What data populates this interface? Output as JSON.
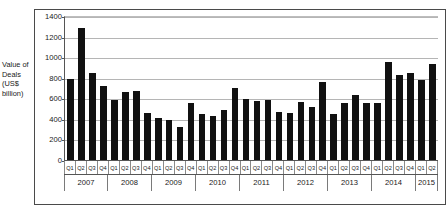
{
  "figure": {
    "faint_title": "",
    "axis_caption_lines": [
      "Value of",
      "Deals",
      "(US$",
      "billion)"
    ]
  },
  "chart_data": {
    "type": "bar",
    "title": "",
    "subtitle": "",
    "xlabel": "",
    "ylabel": "Value of Deals (US$ billion)",
    "ylim": [
      0,
      1400
    ],
    "yticks": [
      0,
      200,
      400,
      600,
      800,
      1000,
      1200,
      1400
    ],
    "ytick_labels": [
      "0",
      "200",
      "400",
      "600",
      "800",
      "1000",
      "1200",
      "1400"
    ],
    "grid": true,
    "legend": null,
    "bar_color": "#111111",
    "categories": [
      "Q1",
      "Q2",
      "Q3",
      "Q4",
      "Q1",
      "Q2",
      "Q3",
      "Q4",
      "Q1",
      "Q2",
      "Q3",
      "Q4",
      "Q1",
      "Q2",
      "Q3",
      "Q4",
      "Q1",
      "Q2",
      "Q3",
      "Q4",
      "Q1",
      "Q2",
      "Q3",
      "Q4",
      "Q1",
      "Q2",
      "Q3",
      "Q4",
      "Q1",
      "Q2",
      "Q3",
      "Q4",
      "Q1",
      "Q2"
    ],
    "values": [
      800,
      1290,
      860,
      730,
      590,
      675,
      685,
      470,
      415,
      400,
      335,
      565,
      460,
      440,
      495,
      710,
      600,
      580,
      590,
      480,
      465,
      570,
      530,
      765,
      455,
      560,
      645,
      565,
      565,
      960,
      840,
      855,
      785,
      940
    ],
    "year_groups": [
      {
        "year": "2007",
        "quarters": 4
      },
      {
        "year": "2008",
        "quarters": 4
      },
      {
        "year": "2009",
        "quarters": 4
      },
      {
        "year": "2010",
        "quarters": 4
      },
      {
        "year": "2011",
        "quarters": 4
      },
      {
        "year": "2012",
        "quarters": 4
      },
      {
        "year": "2013",
        "quarters": 4
      },
      {
        "year": "2014",
        "quarters": 4
      },
      {
        "year": "2015",
        "quarters": 2
      }
    ]
  }
}
